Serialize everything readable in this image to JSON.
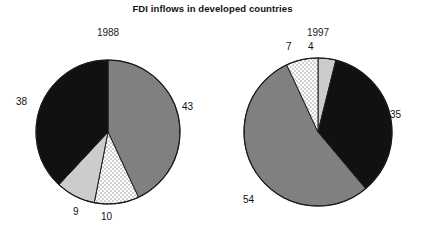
{
  "chart_data": {
    "type": "pie",
    "title": "FDI inflows in developed countries",
    "xlabel": "",
    "ylabel": "",
    "legend": "none",
    "grid": false,
    "charts": [
      {
        "name": "1988",
        "year_label": "1988",
        "center": {
          "x": 108,
          "y": 132
        },
        "radius": 72,
        "start_angle_deg": 0,
        "direction": "clockwise",
        "categories": [
          "43",
          "10",
          "9",
          "38"
        ],
        "values": [
          43,
          10,
          9,
          38
        ],
        "slices": [
          {
            "label": "43",
            "value": 43,
            "fill": "#808080",
            "pattern": "solid",
            "start_deg": 0,
            "end_deg": 155
          },
          {
            "label": "10",
            "value": 10,
            "fill": "#ffffff",
            "pattern": "dots",
            "start_deg": 155,
            "end_deg": 191
          },
          {
            "label": "9",
            "value": 9,
            "fill": "#cccccc",
            "pattern": "solid",
            "start_deg": 191,
            "end_deg": 223
          },
          {
            "label": "38",
            "value": 38,
            "fill": "#111111",
            "pattern": "solid",
            "start_deg": 223,
            "end_deg": 360
          }
        ]
      },
      {
        "name": "1997",
        "year_label": "1997",
        "center": {
          "x": 318,
          "y": 132
        },
        "radius": 74,
        "start_angle_deg": 0,
        "direction": "clockwise",
        "categories": [
          "4",
          "35",
          "54",
          "7"
        ],
        "values": [
          4,
          35,
          54,
          7
        ],
        "slices": [
          {
            "label": "4",
            "value": 4,
            "fill": "#cccccc",
            "pattern": "solid",
            "start_deg": 0,
            "end_deg": 14
          },
          {
            "label": "35",
            "value": 35,
            "fill": "#111111",
            "pattern": "solid",
            "start_deg": 14,
            "end_deg": 140
          },
          {
            "label": "54",
            "value": 54,
            "fill": "#808080",
            "pattern": "solid",
            "start_deg": 140,
            "end_deg": 335
          },
          {
            "label": "7",
            "value": 7,
            "fill": "#ffffff",
            "pattern": "dots",
            "start_deg": 335,
            "end_deg": 360
          }
        ]
      }
    ],
    "colors": {
      "solid_gray": "#808080",
      "light_gray": "#cccccc",
      "black": "#111111",
      "dotted_white": "#ffffff",
      "outline": "#1a1a1a",
      "background": "#ffffff",
      "text": "#111111"
    }
  }
}
